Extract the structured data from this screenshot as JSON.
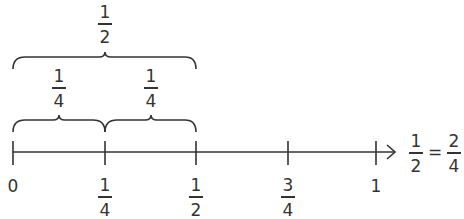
{
  "diagram": {
    "type": "number-line",
    "colors": {
      "line": "#333333",
      "background": "#ffffff"
    },
    "axis": {
      "ticks": [
        {
          "value": "0",
          "num": null,
          "den": null
        },
        {
          "value": "1/4",
          "num": "1",
          "den": "4"
        },
        {
          "value": "1/2",
          "num": "1",
          "den": "2"
        },
        {
          "value": "3/4",
          "num": "3",
          "den": "4"
        },
        {
          "value": "1",
          "num": null,
          "den": null
        }
      ],
      "zero_label": "0",
      "one_label": "1"
    },
    "top_brace": {
      "num": "1",
      "den": "2",
      "spans": "0 to 1/2"
    },
    "lower_braces": [
      {
        "num": "1",
        "den": "4",
        "spans": "0 to 1/4"
      },
      {
        "num": "1",
        "den": "4",
        "spans": "1/4 to 1/2"
      }
    ],
    "equation": {
      "left_num": "1",
      "left_den": "2",
      "operator": "=",
      "right_num": "2",
      "right_den": "4"
    }
  }
}
